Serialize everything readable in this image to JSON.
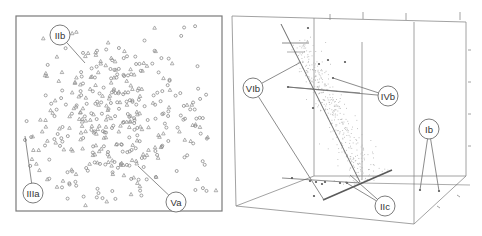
{
  "figure": {
    "left_panel": {
      "type": "2D scatter plot",
      "frame": {
        "x": 16,
        "y": 16,
        "w": 206,
        "h": 195
      },
      "marker_types": [
        "circle",
        "triangle"
      ],
      "point_count": 420,
      "seed": 7,
      "cluster_center": [
        115,
        120
      ],
      "cluster_spread": [
        48,
        42
      ],
      "callouts": [
        {
          "id": "IIb",
          "label": "IIb",
          "cx": 60,
          "cy": 35,
          "r": 10,
          "target": [
            85,
            63
          ]
        },
        {
          "id": "IIIa",
          "label": "IIIa",
          "cx": 33,
          "cy": 193,
          "r": 10,
          "target": [
            25,
            136
          ]
        },
        {
          "id": "Va",
          "label": "Va",
          "cx": 176,
          "cy": 202,
          "r": 10,
          "target": [
            138,
            166
          ]
        }
      ]
    },
    "right_panel": {
      "type": "3D scatter plot",
      "cube": {
        "back_top_left": [
          314,
          18
        ],
        "back_top_right": [
          466,
          18
        ],
        "front_top_left": [
          232,
          16
        ],
        "front_top_right": [
          466,
          22
        ],
        "back_bottom_left": [
          314,
          176
        ],
        "back_bottom_right": [
          466,
          176
        ],
        "front_bottom_left": [
          236,
          206
        ],
        "front_bottom_right": [
          414,
          224
        ]
      },
      "cloud_seed": 11,
      "cloud_count": 420,
      "callouts": [
        {
          "id": "VIb",
          "label": "VIb",
          "cx": 253,
          "cy": 88,
          "r": 10,
          "targets": [
            [
              301,
              62
            ],
            [
              324,
              200
            ]
          ]
        },
        {
          "id": "IVb",
          "label": "IVb",
          "cx": 388,
          "cy": 96,
          "r": 10,
          "targets": [
            [
              333,
              78
            ],
            [
              288,
              87
            ]
          ]
        },
        {
          "id": "Ib",
          "label": "Ib",
          "cx": 429,
          "cy": 129,
          "r": 10,
          "targets": [
            [
              420,
              190
            ],
            [
              439,
              191
            ]
          ]
        },
        {
          "id": "IIc",
          "label": "IIc",
          "cx": 385,
          "cy": 206,
          "r": 10,
          "targets": [
            [
              345,
              182
            ],
            [
              350,
              175
            ]
          ]
        }
      ],
      "isolated_points": [
        [
          308,
          28
        ],
        [
          319,
          64
        ],
        [
          328,
          60
        ],
        [
          345,
          62
        ],
        [
          288,
          87
        ],
        [
          333,
          78
        ],
        [
          313,
          108
        ],
        [
          420,
          190
        ],
        [
          439,
          191
        ],
        [
          314,
          196
        ],
        [
          292,
          178
        ],
        [
          310,
          181
        ],
        [
          316,
          182
        ],
        [
          325,
          182
        ],
        [
          340,
          183
        ],
        [
          347,
          183
        ],
        [
          322,
          184
        ]
      ]
    }
  }
}
